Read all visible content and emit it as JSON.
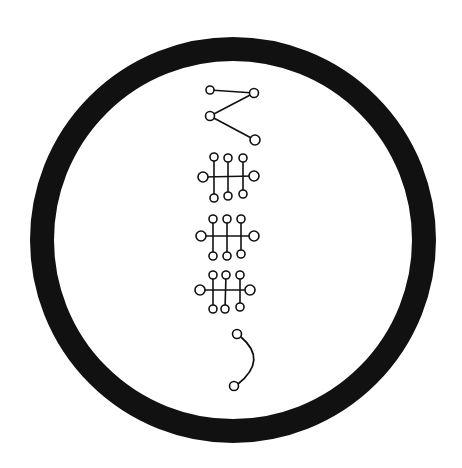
{
  "diagram": {
    "colors": {
      "background": "#ffffff",
      "ink": "#111111"
    },
    "ring": {
      "cx": 233,
      "cy": 240,
      "r": 191,
      "stroke_width": 24
    },
    "glyphs": [
      {
        "name": "glyph-angle",
        "nodes": [
          {
            "x": 210,
            "y": 90,
            "r": 4
          },
          {
            "x": 254,
            "y": 93,
            "r": 4.5
          },
          {
            "x": 210,
            "y": 116,
            "r": 4.5
          },
          {
            "x": 255,
            "y": 140,
            "r": 5
          }
        ],
        "edges": [
          [
            0,
            1
          ],
          [
            1,
            2
          ],
          [
            2,
            3
          ]
        ]
      },
      {
        "name": "glyph-ladder-1",
        "nodes": [
          {
            "x": 203,
            "y": 177,
            "r": 5
          },
          {
            "x": 254,
            "y": 176,
            "r": 5
          },
          {
            "x": 214,
            "y": 157,
            "r": 4
          },
          {
            "x": 228,
            "y": 158,
            "r": 4
          },
          {
            "x": 243,
            "y": 158,
            "r": 4
          },
          {
            "x": 214,
            "y": 198,
            "r": 4
          },
          {
            "x": 228,
            "y": 196,
            "r": 4
          },
          {
            "x": 243,
            "y": 194,
            "r": 4
          }
        ],
        "edges": [
          [
            0,
            1
          ],
          [
            2,
            5
          ],
          [
            3,
            6
          ],
          [
            4,
            7
          ]
        ]
      },
      {
        "name": "glyph-ladder-2",
        "nodes": [
          {
            "x": 201,
            "y": 236,
            "r": 5
          },
          {
            "x": 254,
            "y": 236,
            "r": 5
          },
          {
            "x": 213,
            "y": 219,
            "r": 4
          },
          {
            "x": 227,
            "y": 219,
            "r": 4
          },
          {
            "x": 241,
            "y": 219,
            "r": 4
          },
          {
            "x": 213,
            "y": 256,
            "r": 4
          },
          {
            "x": 227,
            "y": 256,
            "r": 4
          },
          {
            "x": 241,
            "y": 254,
            "r": 4
          }
        ],
        "edges": [
          [
            0,
            1
          ],
          [
            2,
            5
          ],
          [
            3,
            6
          ],
          [
            4,
            7
          ]
        ]
      },
      {
        "name": "glyph-ladder-3",
        "nodes": [
          {
            "x": 200,
            "y": 290,
            "r": 5
          },
          {
            "x": 250,
            "y": 290,
            "r": 5
          },
          {
            "x": 213,
            "y": 275,
            "r": 4
          },
          {
            "x": 226,
            "y": 275,
            "r": 4
          },
          {
            "x": 240,
            "y": 275,
            "r": 4
          },
          {
            "x": 213,
            "y": 309,
            "r": 4
          },
          {
            "x": 225,
            "y": 309,
            "r": 4
          },
          {
            "x": 240,
            "y": 307,
            "r": 4
          }
        ],
        "edges": [
          [
            0,
            1
          ],
          [
            2,
            5
          ],
          [
            3,
            6
          ],
          [
            4,
            7
          ]
        ]
      },
      {
        "name": "glyph-hook",
        "nodes": [
          {
            "x": 237,
            "y": 334,
            "r": 4.5
          },
          {
            "x": 234,
            "y": 386,
            "r": 4.5
          }
        ],
        "arc": {
          "from": [
            241,
            337
          ],
          "control": [
            268,
            360
          ],
          "to": [
            238,
            384
          ]
        }
      }
    ]
  }
}
